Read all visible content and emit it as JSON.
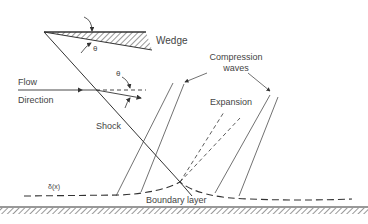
{
  "labels": {
    "wedge": "Wedge",
    "theta_wedge": "θ",
    "theta_flow": "θ",
    "flow": "Flow",
    "direction": "Direction",
    "compression": "Compression",
    "waves": "waves",
    "expansion": "Expansion",
    "shock": "Shock",
    "delta": "δ(x)",
    "boundary_layer": "Boundary layer"
  },
  "colors": {
    "line": "#333333",
    "text": "#444444"
  }
}
